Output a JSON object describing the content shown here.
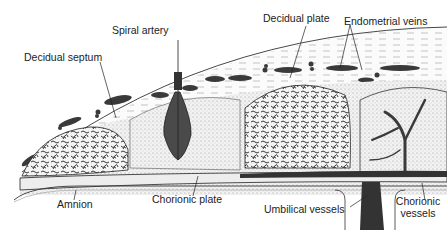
{
  "diagram": {
    "labels": {
      "spiral_artery": "Spiral artery",
      "decidual_septum": "Decidual septum",
      "decidual_plate": "Decidual plate",
      "endometrial_veins": "Endometrial veins",
      "amnion": "Amnion",
      "chorionic_plate": "Chorionic plate",
      "umbilical_vessels": "Umbilical vessels",
      "chorionic_vessels_line1": "Chorionic",
      "chorionic_vessels_line2": "vessels"
    },
    "colors": {
      "ink": "#222222",
      "stipple_fill": "#e6e6e6",
      "vessel_dark": "#3a3a3a",
      "background": "#ffffff"
    }
  }
}
